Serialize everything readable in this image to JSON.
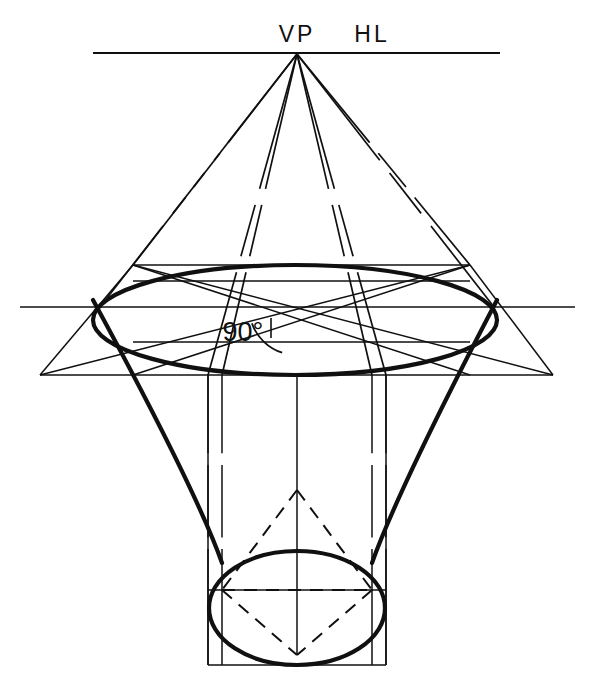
{
  "figure": {
    "background_color": "#ffffff",
    "ink_color": "#101010",
    "width": 595,
    "height": 690
  },
  "labels": {
    "vanishing_point": "VP",
    "horizon_line": "HL",
    "right_angle": "90°"
  },
  "label_positions": {
    "vanishing_point": {
      "x": 297,
      "y": 42,
      "font_size": 23,
      "letter_spacing": 3
    },
    "horizon_line": {
      "x": 372,
      "y": 42,
      "font_size": 23,
      "letter_spacing": 3
    },
    "right_angle": {
      "x": 243,
      "y": 341,
      "font_size": 27,
      "letter_spacing": 0
    }
  },
  "geometry": {
    "horizon_line": {
      "x1": 93,
      "y1": 53,
      "x2": 500,
      "y2": 53,
      "stroke_width": 2.0
    },
    "vanishing_point": {
      "x": 297,
      "y": 54
    },
    "center_line": {
      "x1": 297,
      "y1": 307,
      "x2": 297,
      "y2": 375
    },
    "ground_line": {
      "x1": 20,
      "y1": 307,
      "x2": 575,
      "y2": 307,
      "stroke_width": 1.6
    },
    "top_ellipse": {
      "cx": 295,
      "cy": 320,
      "rx": 202,
      "ry": 55,
      "stroke_width": 4.2,
      "note": "major ellipse in perspective, heavy outline"
    },
    "bottom_ellipse": {
      "cx": 297,
      "cy": 608,
      "rx": 88,
      "ry": 57,
      "stroke_width": 4.2,
      "note": "lower circle of funnel seen in perspective"
    },
    "upper_box": {
      "top_y": 265,
      "bottom_y": 375,
      "left_top_x": 133,
      "right_top_x": 470,
      "left_bottom_x": 40,
      "right_bottom_x": 553,
      "stroke_width": 1.5
    },
    "lower_box": {
      "left_x": 208,
      "right_x": 386,
      "top_y": 375,
      "bottom_y": 665,
      "stroke_width": 1.5
    },
    "vp_rays_solid": [
      {
        "x1": 297,
        "y1": 54,
        "x2": 133,
        "y2": 265
      },
      {
        "x1": 297,
        "y1": 54,
        "x2": 470,
        "y2": 265
      },
      {
        "x1": 297,
        "y1": 54,
        "x2": 100,
        "y2": 307
      },
      {
        "x1": 297,
        "y1": 54,
        "x2": 494,
        "y2": 307
      },
      {
        "x1": 297,
        "y1": 54,
        "x2": 222,
        "y2": 375
      },
      {
        "x1": 297,
        "y1": 54,
        "x2": 372,
        "y2": 375
      },
      {
        "x1": 297,
        "y1": 54,
        "x2": 208,
        "y2": 375
      },
      {
        "x1": 297,
        "y1": 54,
        "x2": 386,
        "y2": 375
      }
    ],
    "ray_dash_gaps": [
      {
        "start_t": 0.42,
        "end_t": 0.47
      },
      {
        "start_t": 0.63,
        "end_t": 0.68
      }
    ],
    "cone_sides": [
      {
        "x1": 93,
        "y1": 300,
        "x2": 222,
        "y2": 563,
        "stroke_width": 4.2
      },
      {
        "x1": 497,
        "y1": 300,
        "x2": 372,
        "y2": 563,
        "stroke_width": 4.2
      }
    ],
    "diagonal_chords": [
      {
        "x1": 133,
        "y1": 265,
        "x2": 470,
        "y2": 375
      },
      {
        "x1": 470,
        "y1": 265,
        "x2": 133,
        "y2": 375
      },
      {
        "x1": 40,
        "y1": 375,
        "x2": 470,
        "y2": 265
      },
      {
        "x1": 553,
        "y1": 375,
        "x2": 133,
        "y2": 265
      }
    ],
    "horizontal_guides": [
      {
        "x1": 133,
        "y1": 281,
        "x2": 470,
        "y2": 281
      },
      {
        "x1": 133,
        "y1": 342,
        "x2": 470,
        "y2": 342
      },
      {
        "x1": 208,
        "y1": 590,
        "x2": 386,
        "y2": 590
      }
    ],
    "vertical_guides": [
      {
        "x1": 208,
        "y1": 375,
        "x2": 208,
        "y2": 665
      },
      {
        "x1": 222,
        "y1": 375,
        "x2": 222,
        "y2": 665
      },
      {
        "x1": 372,
        "y1": 375,
        "x2": 372,
        "y2": 665
      },
      {
        "x1": 386,
        "y1": 375,
        "x2": 386,
        "y2": 665
      },
      {
        "x1": 297,
        "y1": 375,
        "x2": 297,
        "y2": 655
      }
    ],
    "dashed_diamond": [
      {
        "x1": 297,
        "y1": 490,
        "x2": 222,
        "y2": 590
      },
      {
        "x1": 297,
        "y1": 490,
        "x2": 372,
        "y2": 590
      },
      {
        "x1": 222,
        "y1": 590,
        "x2": 297,
        "y2": 655
      },
      {
        "x1": 372,
        "y1": 590,
        "x2": 297,
        "y2": 655
      },
      {
        "x1": 222,
        "y1": 590,
        "x2": 372,
        "y2": 590
      }
    ],
    "right_angle_arc": {
      "cx": 297,
      "cy": 307,
      "r": 48,
      "start_angle_deg": 108,
      "end_angle_deg": 160
    },
    "right_angle_tick": {
      "x1": 271,
      "y1": 318,
      "x2": 271,
      "y2": 338
    }
  }
}
